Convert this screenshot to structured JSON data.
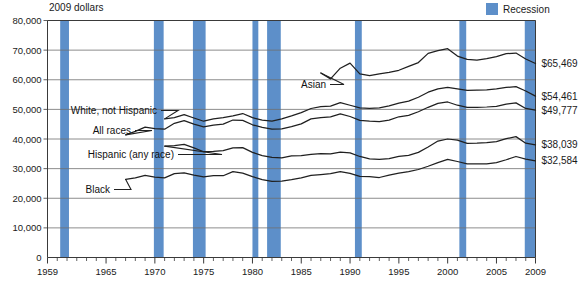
{
  "header": {
    "units_label": "2009 dollars"
  },
  "legend": {
    "items": [
      {
        "label": "Recession",
        "color": "#5d8fc9",
        "swatch": "recession-swatch"
      }
    ]
  },
  "chart_data": {
    "type": "line",
    "title": "",
    "subtitle": "",
    "xlabel": "",
    "ylabel": "2009 dollars",
    "grid": true,
    "legend_position": "top-right",
    "xlim": [
      1959,
      2009
    ],
    "ylim": [
      0,
      80000
    ],
    "yticks": [
      0,
      10000,
      20000,
      30000,
      40000,
      50000,
      60000,
      70000,
      80000
    ],
    "ytick_labels": [
      "0",
      "10,000",
      "20,000",
      "30,000",
      "40,000",
      "50,000",
      "60,000",
      "70,000",
      "80,000"
    ],
    "xticks": [
      1959,
      1965,
      1970,
      1975,
      1980,
      1985,
      1990,
      1995,
      2000,
      2005,
      2009
    ],
    "xtick_labels": [
      "1959",
      "1965",
      "1970",
      "1975",
      "1980",
      "1985",
      "1990",
      "1995",
      "2000",
      "2005",
      "2009"
    ],
    "x": [
      1959,
      1960,
      1961,
      1962,
      1963,
      1964,
      1965,
      1966,
      1967,
      1968,
      1969,
      1970,
      1971,
      1972,
      1973,
      1974,
      1975,
      1976,
      1977,
      1978,
      1979,
      1980,
      1981,
      1982,
      1983,
      1984,
      1985,
      1986,
      1987,
      1988,
      1989,
      1990,
      1991,
      1992,
      1993,
      1994,
      1995,
      1996,
      1997,
      1998,
      1999,
      2000,
      2001,
      2002,
      2003,
      2004,
      2005,
      2006,
      2007,
      2008,
      2009
    ],
    "series": [
      {
        "name": "Asian",
        "label": "Asian",
        "end_value_label": "$65,469",
        "end_value": 65469,
        "x_start": 1987,
        "values": [
          null,
          null,
          null,
          null,
          null,
          null,
          null,
          null,
          null,
          null,
          null,
          null,
          null,
          null,
          null,
          null,
          null,
          null,
          null,
          null,
          null,
          null,
          null,
          null,
          null,
          null,
          null,
          null,
          62300,
          60300,
          63900,
          65600,
          62000,
          61400,
          62000,
          62500,
          63200,
          64500,
          65800,
          68900,
          69800,
          70500,
          68000,
          66900,
          66600,
          67100,
          67800,
          68800,
          69000,
          67000,
          65469
        ]
      },
      {
        "name": "White, not Hispanic",
        "label": "White, not Hispanic",
        "end_value_label": "$54,461",
        "end_value": 54461,
        "x_start": 1972,
        "values": [
          null,
          null,
          null,
          null,
          null,
          null,
          null,
          null,
          null,
          null,
          null,
          null,
          46800,
          47200,
          48200,
          47100,
          46000,
          46800,
          47200,
          47800,
          48600,
          47200,
          46400,
          46000,
          46800,
          47800,
          48900,
          50300,
          50900,
          51100,
          52300,
          51400,
          50500,
          50300,
          50500,
          51200,
          52100,
          52800,
          54100,
          55800,
          56900,
          57400,
          56900,
          56400,
          56500,
          56600,
          56900,
          57400,
          57700,
          56200,
          54461
        ]
      },
      {
        "name": "All races",
        "label": "All races",
        "end_value_label": "$49,777",
        "end_value": 49777,
        "x_start": 1967,
        "values": [
          null,
          null,
          null,
          null,
          null,
          null,
          null,
          null,
          41400,
          42600,
          44000,
          43500,
          43300,
          45300,
          46200,
          45000,
          44100,
          44700,
          45000,
          46400,
          46300,
          44800,
          43900,
          43300,
          43400,
          44200,
          45100,
          46800,
          47200,
          47500,
          48500,
          47600,
          46300,
          46000,
          45900,
          46400,
          47500,
          48000,
          49200,
          50700,
          52000,
          52500,
          51400,
          50700,
          50700,
          50800,
          51000,
          51800,
          52200,
          50300,
          49777
        ]
      },
      {
        "name": "Hispanic (any race)",
        "label": "Hispanic (any race)",
        "end_value_label": "$38,039",
        "end_value": 38039,
        "x_start": 1972,
        "values": [
          null,
          null,
          null,
          null,
          null,
          null,
          null,
          null,
          null,
          null,
          null,
          null,
          37600,
          37800,
          38200,
          37000,
          35700,
          35800,
          36100,
          37000,
          37100,
          35500,
          34400,
          33800,
          33600,
          34300,
          34400,
          34800,
          35100,
          35000,
          35600,
          35300,
          34100,
          33300,
          33100,
          33400,
          34100,
          34500,
          35500,
          37300,
          39300,
          40000,
          39600,
          38500,
          38600,
          38800,
          39100,
          40100,
          40800,
          38600,
          38039
        ]
      },
      {
        "name": "Black",
        "label": "Black",
        "end_value_label": "$32,584",
        "end_value": 32584,
        "x_start": 1967,
        "values": [
          null,
          null,
          null,
          null,
          null,
          null,
          null,
          null,
          26400,
          26900,
          27700,
          27100,
          26900,
          28300,
          28600,
          27800,
          27200,
          27600,
          27600,
          29000,
          28500,
          27300,
          26300,
          25700,
          25800,
          26300,
          26900,
          27700,
          28000,
          28300,
          29000,
          28400,
          27400,
          27300,
          27000,
          27800,
          28500,
          29000,
          29700,
          30800,
          32000,
          33100,
          32400,
          31600,
          31600,
          31600,
          32000,
          33000,
          34100,
          33200,
          32584
        ]
      }
    ],
    "annotations": {
      "recession_bands": [
        {
          "start": 1960.3,
          "end": 1961.2,
          "name": "recession-1960"
        },
        {
          "start": 1969.9,
          "end": 1970.9,
          "name": "recession-1970"
        },
        {
          "start": 1973.9,
          "end": 1975.2,
          "name": "recession-1974"
        },
        {
          "start": 1980.0,
          "end": 1980.6,
          "name": "recession-1980"
        },
        {
          "start": 1981.5,
          "end": 1982.9,
          "name": "recession-1981"
        },
        {
          "start": 1990.5,
          "end": 1991.2,
          "name": "recession-1990"
        },
        {
          "start": 2001.2,
          "end": 2001.9,
          "name": "recession-2001"
        },
        {
          "start": 2007.9,
          "end": 2009.0,
          "name": "recession-2008"
        }
      ]
    }
  }
}
